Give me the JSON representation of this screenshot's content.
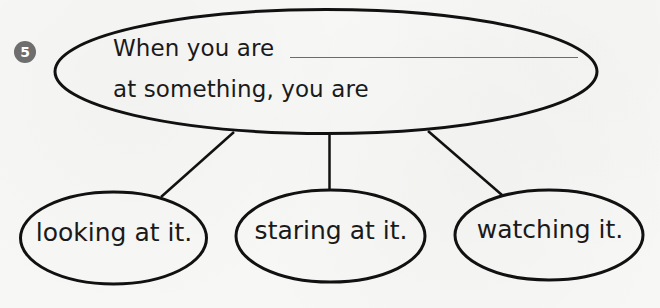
{
  "question": {
    "number": "5",
    "prompt_line_1": "When you are",
    "prompt_line_2": "at something, you are",
    "blank": ""
  },
  "answers": [
    {
      "label": "looking at it."
    },
    {
      "label": "staring at it."
    },
    {
      "label": "watching it."
    }
  ],
  "colors": {
    "stroke": "#111111",
    "badge": "#6e6e6e",
    "background": "#f7f7f6",
    "blank_line": "#6b6b6b"
  }
}
